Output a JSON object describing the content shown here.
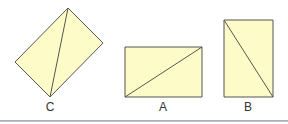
{
  "colors": {
    "fill": "#fdfbc8",
    "stroke": "#555555",
    "rule": "#9aa4ad"
  },
  "shapes": [
    {
      "label": "C",
      "points": "68,8 103,43 50,97 15,62",
      "diagonal": [
        68,
        8,
        50,
        97
      ],
      "label_x": 50
    },
    {
      "label": "A",
      "points": "125,47 202,47 202,97 125,97",
      "diagonal": [
        125,
        97,
        202,
        47
      ],
      "label_x": 163
    },
    {
      "label": "B",
      "points": "224,20 273,20 273,97 224,97",
      "diagonal": [
        224,
        20,
        273,
        97
      ],
      "label_x": 248
    }
  ]
}
